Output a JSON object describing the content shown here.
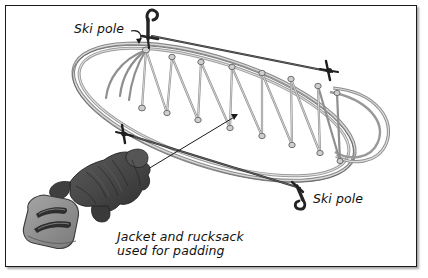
{
  "figure": {
    "border_color": "#1a1a1a",
    "background_color": "#ffffff"
  },
  "labels": {
    "ski_pole_top": "Ski pole",
    "ski_pole_bottom": "Ski pole",
    "padding_line1": "Jacket and rucksack",
    "padding_line2": "used for padding"
  },
  "colors": {
    "ink": "#111111",
    "line": "#5a5a5a",
    "line_dark": "#2b2b2b",
    "jacket": "#4a4a4a",
    "jacket_shadow": "#333333",
    "rucksack": "#8c8c8c",
    "rucksack_strap": "#2e2e2e",
    "pole": "#1f1f1f"
  },
  "items": [
    {
      "name": "ski-sled-frame",
      "kind": "oval-ski-loop"
    },
    {
      "name": "rope-lattice",
      "kind": "zigzag-lacing",
      "rungs": 9
    },
    {
      "name": "ski-pole-upper",
      "kind": "pole-with-basket"
    },
    {
      "name": "ski-pole-lower",
      "kind": "pole-with-basket"
    },
    {
      "name": "jacket",
      "kind": "padding"
    },
    {
      "name": "rucksack",
      "kind": "padding"
    }
  ]
}
